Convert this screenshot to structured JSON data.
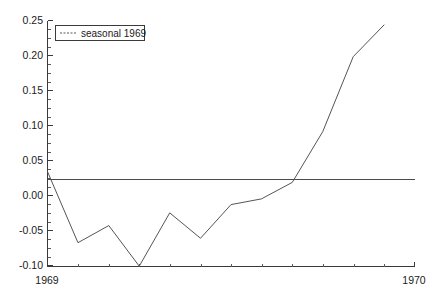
{
  "chart_data": {
    "type": "line",
    "title": "",
    "subtitle": "",
    "xlabel": "",
    "ylabel": "",
    "xlim": [
      1969.0,
      1970.0
    ],
    "ylim": [
      -0.1375,
      0.25
    ],
    "grid": false,
    "legend_position": "top-left",
    "zero_reference_line": 0.0,
    "x_tick_labels": [
      "1969",
      "1970"
    ],
    "x_tick_values": [
      1969.0,
      1970.0
    ],
    "x_minor_tick_count": 12,
    "y_tick_labels": [
      "0.25",
      "0.20",
      "0.15",
      "0.10",
      "0.05",
      "0.00",
      "-0.05",
      "-0.10"
    ],
    "y_tick_values": [
      0.25,
      0.2,
      0.15,
      0.1,
      0.05,
      0.0,
      -0.05,
      -0.1
    ],
    "y_minor_tick_step": 0.0125,
    "series": [
      {
        "name": "seasonal 1969",
        "line_style": "dotted",
        "color": "#555555",
        "x": [
          1969.0,
          1969.083,
          1969.167,
          1969.25,
          1969.333,
          1969.417,
          1969.5,
          1969.583,
          1969.667,
          1969.75,
          1969.833,
          1969.917
        ],
        "values": [
          0.012,
          -0.1,
          -0.073,
          -0.137,
          -0.053,
          -0.093,
          -0.04,
          -0.031,
          -0.005,
          0.075,
          0.193,
          0.243
        ]
      }
    ],
    "legend_entries": [
      "seasonal 1969"
    ]
  },
  "legend": {
    "entry_label": "seasonal 1969"
  },
  "axes": {
    "y_labels": [
      "0.25",
      "0.20",
      "0.15",
      "0.10",
      "0.05",
      "0.00",
      "-0.05",
      "-0.10"
    ],
    "x_labels": [
      "1969",
      "1970"
    ]
  }
}
